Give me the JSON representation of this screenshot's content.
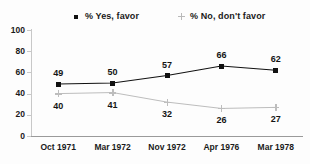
{
  "chart_data": {
    "type": "line",
    "title": "",
    "xlabel": "",
    "ylabel": "",
    "ylim": [
      0,
      100
    ],
    "yticks": [
      0,
      20,
      40,
      60,
      80,
      100
    ],
    "grid": false,
    "legend_position": "top",
    "categories": [
      "Oct 1971",
      "Mar 1972",
      "Nov 1972",
      "Apr 1976",
      "Mar 1978"
    ],
    "series": [
      {
        "name": "% Yes, favor",
        "marker": "square",
        "color": "#111111",
        "label_position": "above",
        "values": [
          49,
          50,
          57,
          66,
          62
        ]
      },
      {
        "name": "% No, don't favor",
        "marker": "plus",
        "color": "#bdbdbd",
        "label_position": "below",
        "values": [
          40,
          41,
          32,
          26,
          27
        ]
      }
    ]
  },
  "legend": {
    "yes_label": "% Yes, favor",
    "no_label": "% No, don't favor"
  }
}
